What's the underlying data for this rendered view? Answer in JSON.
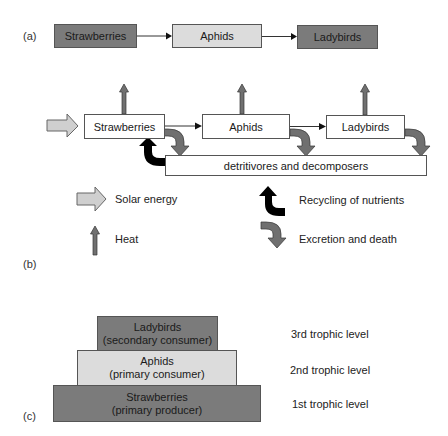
{
  "panel_a": {
    "label": "(a)",
    "chain": [
      {
        "name": "Strawberries",
        "shade": "dark"
      },
      {
        "name": "Aphids",
        "shade": "light"
      },
      {
        "name": "Ladybirds",
        "shade": "dark"
      }
    ]
  },
  "panel_b": {
    "label": "(b)",
    "chain": [
      "Strawberries",
      "Aphids",
      "Ladybirds"
    ],
    "detritus_box": "detritivores and decomposers",
    "legend": {
      "solar": "Solar energy",
      "heat": "Heat",
      "recycling": "Recycling of nutrients",
      "excretion": "Excretion and death"
    }
  },
  "panel_c": {
    "label": "(c)",
    "pyramid": [
      {
        "name": "Ladybirds",
        "role": "(secondary consumer)",
        "level": "3rd trophic level",
        "shade": "dark"
      },
      {
        "name": "Aphids",
        "role": "(primary consumer)",
        "level": "2nd trophic level",
        "shade": "light"
      },
      {
        "name": "Strawberries",
        "role": "(primary producer)",
        "level": "1st trophic level",
        "shade": "dark"
      }
    ]
  },
  "colors": {
    "dark_box": "#7b7b7b",
    "light_box": "#dcdcdc",
    "heat_arrow": "#707070",
    "solar_arrow": "#cfcfcf",
    "recycling_arrow": "#000000",
    "excretion_arrow": "#707070"
  }
}
